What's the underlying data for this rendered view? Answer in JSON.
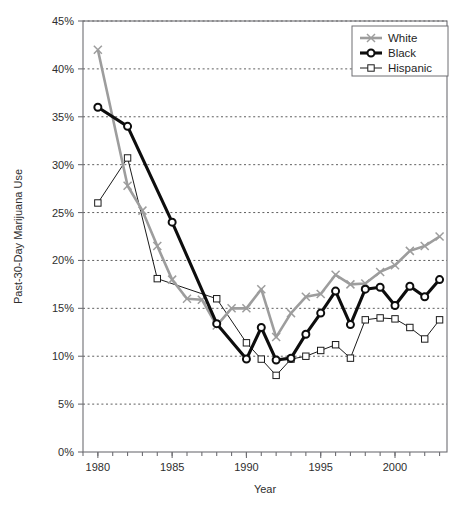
{
  "chart_data": {
    "type": "line",
    "title": "",
    "xlabel": "Year",
    "ylabel": "Past-30-Day Marijuana Use",
    "xlim": [
      1979,
      2003.5
    ],
    "ylim": [
      0,
      45
    ],
    "y_tick_labels": [
      "0%",
      "5%",
      "10%",
      "15%",
      "20%",
      "25%",
      "30%",
      "35%",
      "40%",
      "45%"
    ],
    "y_ticks": [
      0,
      5,
      10,
      15,
      20,
      25,
      30,
      35,
      40,
      45
    ],
    "x_tick_labels": [
      "1980",
      "1985",
      "1990",
      "1995",
      "2000"
    ],
    "x_ticks": [
      1980,
      1985,
      1990,
      1995,
      2000
    ],
    "x_minor_ticks": [
      1979,
      1980,
      1981,
      1982,
      1983,
      1984,
      1985,
      1986,
      1987,
      1988,
      1989,
      1990,
      1991,
      1992,
      1993,
      1994,
      1995,
      1996,
      1997,
      1998,
      1999,
      2000,
      2001,
      2002,
      2003
    ],
    "grid": "horizontal-dotted",
    "legend_position": "top-right",
    "series": [
      {
        "name": "White",
        "color": "#9d9d9d",
        "marker": "x",
        "x": [
          1980,
          1982,
          1983,
          1984,
          1985,
          1986,
          1987,
          1988,
          1989,
          1990,
          1991,
          1992,
          1993,
          1994,
          1995,
          1996,
          1997,
          1998,
          1999,
          2000,
          2001,
          2002,
          2003
        ],
        "values": [
          42.0,
          27.8,
          25.2,
          21.5,
          18.0,
          16.0,
          15.9,
          13.2,
          15.0,
          15.0,
          17.0,
          12.0,
          14.5,
          16.2,
          16.5,
          18.5,
          17.5,
          17.6,
          18.8,
          19.5,
          21.0,
          21.5,
          22.5
        ]
      },
      {
        "name": "Black",
        "color": "#0d0d0d",
        "marker": "circle",
        "x": [
          1980,
          1982,
          1985,
          1988,
          1990,
          1991,
          1992,
          1993,
          1994,
          1995,
          1996,
          1997,
          1998,
          1999,
          2000,
          2001,
          2002,
          2003
        ],
        "values": [
          36.0,
          34.0,
          24.0,
          13.4,
          9.7,
          13.0,
          9.6,
          9.8,
          12.3,
          14.5,
          16.8,
          13.3,
          17.0,
          17.2,
          15.3,
          17.3,
          16.2,
          18.0
        ]
      },
      {
        "name": "Hispanic",
        "color": "#1a1a1a",
        "marker": "square",
        "x": [
          1980,
          1982,
          1984,
          1988,
          1990,
          1991,
          1992,
          1993,
          1994,
          1995,
          1996,
          1997,
          1998,
          1999,
          2000,
          2001,
          2002,
          2003
        ],
        "values": [
          26.0,
          30.7,
          18.1,
          16.0,
          11.4,
          9.7,
          8.0,
          9.7,
          10.0,
          10.6,
          11.2,
          9.8,
          13.8,
          14.0,
          13.9,
          13.0,
          11.8,
          13.8
        ]
      }
    ]
  },
  "legend": {
    "entries": [
      {
        "label": "White"
      },
      {
        "label": "Black"
      },
      {
        "label": "Hispanic"
      }
    ]
  },
  "axes": {
    "y_title": "Past-30-Day Marijuana Use",
    "x_title": "Year"
  }
}
